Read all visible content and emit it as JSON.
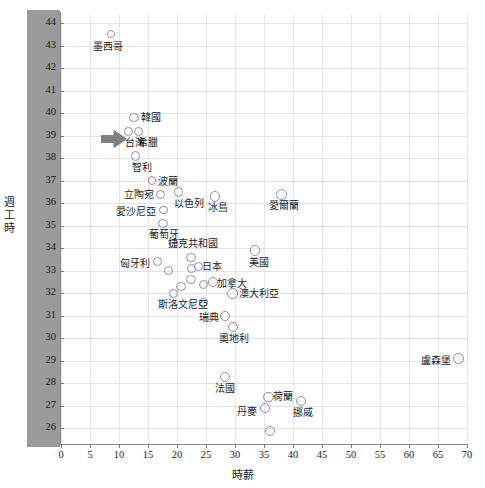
{
  "chart_data": {
    "type": "scatter",
    "title": "",
    "xlabel": "時薪",
    "ylabel": "週工時",
    "xlim": [
      0,
      70
    ],
    "ylim": [
      25.4,
      44.4
    ],
    "xticks": [
      0,
      5,
      10,
      15,
      20,
      25,
      30,
      35,
      40,
      45,
      50,
      55,
      60,
      65,
      70
    ],
    "yticks": [
      26,
      27,
      28,
      29,
      30,
      31,
      32,
      33,
      34,
      35,
      36,
      37,
      38,
      39,
      40,
      41,
      42,
      43,
      44
    ],
    "grid": true,
    "legend": "none",
    "marker_color": "#8f8f96",
    "marker_fill": "none",
    "points": [
      {
        "label": "墨西哥",
        "x": 8.6,
        "y": 43.5,
        "r": 4.0,
        "lx": -18,
        "ly": 7
      },
      {
        "label": "韓國",
        "x": 12.6,
        "y": 39.8,
        "r": 4.6,
        "lx": 7,
        "ly": -6
      },
      {
        "label": "台灣",
        "x": 11.6,
        "y": 39.2,
        "r": 4.4,
        "lx": -3,
        "ly": 6,
        "highlight": true
      },
      {
        "label": "希臘",
        "x": 13.3,
        "y": 39.2,
        "r": 4.4,
        "lx": 0,
        "ly": 6
      },
      {
        "label": "智利",
        "x": 12.8,
        "y": 38.1,
        "r": 4.6,
        "lx": -3,
        "ly": 6
      },
      {
        "label": "波蘭",
        "x": 15.7,
        "y": 37.0,
        "r": 4.4,
        "lx": 6,
        "ly": -5
      },
      {
        "label": "立陶宛",
        "x": 17.1,
        "y": 36.4,
        "r": 4.6,
        "lx": -36,
        "ly": -5
      },
      {
        "label": "以色列",
        "x": 20.3,
        "y": 36.5,
        "r": 4.6,
        "lx": -5,
        "ly": 6
      },
      {
        "label": "冰島",
        "x": 26.6,
        "y": 36.3,
        "r": 5.2,
        "lx": -7,
        "ly": 6
      },
      {
        "label": "愛爾蘭",
        "x": 38.0,
        "y": 36.4,
        "r": 5.4,
        "lx": -12,
        "ly": 6
      },
      {
        "label": "愛沙尼亞",
        "x": 17.7,
        "y": 35.7,
        "r": 4.4,
        "lx": -48,
        "ly": -4
      },
      {
        "label": "葡萄牙",
        "x": 17.6,
        "y": 35.1,
        "r": 4.6,
        "lx": -14,
        "ly": 6
      },
      {
        "label": "捷克共和國",
        "x": 19.4,
        "y": 34.2,
        "r": 4.6,
        "lx": -6,
        "ly": -6
      },
      {
        "label": "美國",
        "x": 33.4,
        "y": 33.9,
        "r": 5.2,
        "lx": -6,
        "ly": 6
      },
      {
        "label": "匈牙利",
        "x": 16.7,
        "y": 33.4,
        "r": 4.4,
        "lx": -38,
        "ly": -4
      },
      {
        "label": "",
        "x": 18.6,
        "y": 33.0,
        "r": 4.6,
        "lx": 0,
        "ly": 0
      },
      {
        "label": "",
        "x": 22.4,
        "y": 33.6,
        "r": 4.6,
        "lx": 0,
        "ly": 0
      },
      {
        "label": "",
        "x": 22.5,
        "y": 33.1,
        "r": 4.6,
        "lx": 0,
        "ly": 0
      },
      {
        "label": "日本",
        "x": 23.7,
        "y": 33.2,
        "r": 4.6,
        "lx": 4,
        "ly": -5
      },
      {
        "label": "",
        "x": 22.4,
        "y": 32.6,
        "r": 4.6,
        "lx": 0,
        "ly": 0
      },
      {
        "label": "加拿大",
        "x": 26.2,
        "y": 32.5,
        "r": 5.0,
        "lx": 4,
        "ly": -4
      },
      {
        "label": "",
        "x": 24.5,
        "y": 32.4,
        "r": 4.6,
        "lx": 0,
        "ly": 0
      },
      {
        "label": "",
        "x": 20.7,
        "y": 32.3,
        "r": 4.6,
        "lx": 0,
        "ly": 0
      },
      {
        "label": "",
        "x": 19.4,
        "y": 32.0,
        "r": 4.6,
        "lx": 0,
        "ly": 0
      },
      {
        "label": "澳大利亞",
        "x": 29.6,
        "y": 32.0,
        "r": 5.2,
        "lx": 6,
        "ly": -5
      },
      {
        "label": "斯洛文尼亞",
        "x": 24.6,
        "y": 31.6,
        "r": 4.6,
        "lx": -46,
        "ly": -3
      },
      {
        "label": "瑞典",
        "x": 28.3,
        "y": 31.0,
        "r": 5.0,
        "lx": -26,
        "ly": -4
      },
      {
        "label": "奧地利",
        "x": 29.7,
        "y": 30.5,
        "r": 5.2,
        "lx": -14,
        "ly": 6
      },
      {
        "label": "盧森堡",
        "x": 68.6,
        "y": 29.1,
        "r": 5.4,
        "lx": -38,
        "ly": -4
      },
      {
        "label": "法國",
        "x": 28.3,
        "y": 28.3,
        "r": 5.0,
        "lx": -10,
        "ly": 6
      },
      {
        "label": "荷蘭",
        "x": 35.8,
        "y": 27.4,
        "r": 5.2,
        "lx": 4,
        "ly": -6
      },
      {
        "label": "丹麥",
        "x": 35.2,
        "y": 26.9,
        "r": 5.2,
        "lx": -28,
        "ly": -2
      },
      {
        "label": "挪威",
        "x": 41.3,
        "y": 27.2,
        "r": 5.0,
        "lx": -8,
        "ly": 6
      },
      {
        "label": "",
        "x": 36.1,
        "y": 25.9,
        "r": 5.0,
        "lx": 0,
        "ly": 0
      }
    ],
    "annotations": [
      {
        "type": "arrow",
        "label": "taiwan-pointer",
        "x": 9.1,
        "y": 38.85,
        "direction": "right",
        "color": "#808080"
      }
    ]
  }
}
